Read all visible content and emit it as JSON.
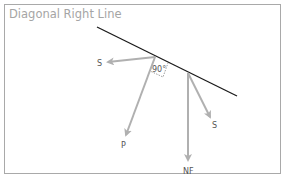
{
  "title": "Diagonal Right Line",
  "colors": {
    "frame": "#a9a9a9",
    "title": "#a5a5a5",
    "line": "#1a1a1a",
    "arrows": "#b0b0b0",
    "label": "#555555"
  },
  "diagram": {
    "surface_line": {
      "x1": 97,
      "y1": 27,
      "x2": 237,
      "y2": 96
    },
    "right_angle_label": "90°",
    "vectors": [
      {
        "name": "S",
        "label": "S",
        "from": [
          155,
          57
        ],
        "to": [
          106,
          62
        ],
        "label_pos": [
          97,
          66
        ]
      },
      {
        "name": "P",
        "label": "P",
        "from": [
          155,
          57
        ],
        "to": [
          124,
          138
        ],
        "label_pos": [
          121,
          148
        ]
      },
      {
        "name": "NF",
        "label": "NF",
        "from": [
          188,
          73
        ],
        "to": [
          188,
          163
        ],
        "label_pos": [
          184,
          174
        ]
      },
      {
        "name": "S",
        "label": "S",
        "from": [
          188,
          73
        ],
        "to": [
          211,
          120
        ],
        "label_pos": [
          212,
          127
        ]
      }
    ]
  }
}
